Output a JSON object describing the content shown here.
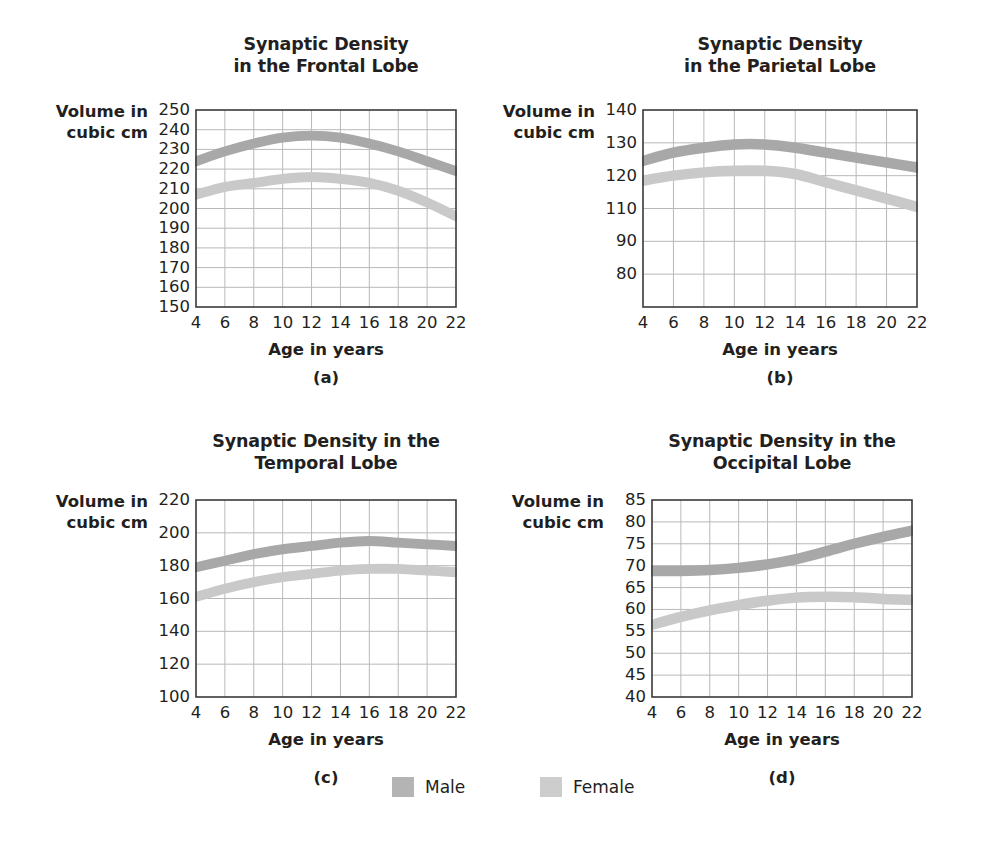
{
  "figure": {
    "axis_label": "Volume in\ncubic cm",
    "x_axis_label": "Age in years",
    "background_color": "#ffffff",
    "text_color": "#231f20",
    "grid_color": "#b9b9b9",
    "frame_color": "#3a3a3a",
    "male_color": "#a8a8a8",
    "female_color": "#c9c9c9"
  },
  "legend": {
    "entries": [
      {
        "label": "Male",
        "color": "#b4b4b4",
        "swatch": "male-swatch"
      },
      {
        "label": "Female",
        "color": "#cdcdcd",
        "swatch": "female-swatch"
      }
    ]
  },
  "chart_data": [
    {
      "id": "frontal",
      "type": "line",
      "letter": "(a)",
      "title": "Synaptic Density\nin the Frontal Lobe",
      "title_line1": "Synaptic Density",
      "title_line2": "in the Frontal Lobe",
      "xlabel": "Age in years",
      "ylabel": "Volume in cubic cm",
      "x": [
        4,
        6,
        8,
        10,
        12,
        14,
        16,
        18,
        20,
        22
      ],
      "xticks": [
        4,
        6,
        8,
        10,
        12,
        14,
        16,
        18,
        20,
        22
      ],
      "yticks": [
        250,
        240,
        230,
        220,
        210,
        200,
        190,
        180,
        170,
        160,
        150
      ],
      "xlim": [
        4,
        22
      ],
      "ylim": [
        150,
        250
      ],
      "grid": true,
      "band_width": 5,
      "series": [
        {
          "name": "Male",
          "color": "#a8a8a8",
          "values": [
            224,
            229,
            233,
            236,
            237,
            236,
            233,
            229,
            224,
            219
          ]
        },
        {
          "name": "Female",
          "color": "#c9c9c9",
          "values": [
            207,
            211,
            213,
            215,
            216,
            215,
            213,
            209,
            203,
            196
          ]
        }
      ]
    },
    {
      "id": "parietal",
      "type": "line",
      "letter": "(b)",
      "title": "Synaptic Density\nin the Parietal Lobe",
      "title_line1": "Synaptic Density",
      "title_line2": "in the Parietal Lobe",
      "xlabel": "Age in years",
      "ylabel": "Volume in cubic cm",
      "x": [
        4,
        6,
        8,
        10,
        12,
        14,
        16,
        18,
        20,
        22
      ],
      "xticks": [
        4,
        6,
        8,
        10,
        12,
        14,
        16,
        18,
        20,
        22
      ],
      "yticks": [
        140,
        130,
        120,
        110,
        90,
        80
      ],
      "ytick_positions": [
        140,
        130,
        120,
        110,
        100,
        90
      ],
      "xlim": [
        4,
        22
      ],
      "ylim": [
        80,
        140
      ],
      "grid": true,
      "band_width": 3.2,
      "series": [
        {
          "name": "Male",
          "color": "#a8a8a8",
          "values": [
            124.5,
            127,
            128.5,
            129.5,
            129.5,
            128.5,
            127,
            125.5,
            124,
            122.5
          ]
        },
        {
          "name": "Female",
          "color": "#c9c9c9",
          "values": [
            118.5,
            120,
            121,
            121.5,
            121.5,
            120.5,
            118,
            115.5,
            113,
            110.5
          ]
        }
      ]
    },
    {
      "id": "temporal",
      "type": "line",
      "letter": "(c)",
      "title": "Synaptic Density in the\nTemporal Lobe",
      "title_line1": "Synaptic Density in the",
      "title_line2": "Temporal Lobe",
      "xlabel": "Age in years",
      "ylabel": "Volume in cubic cm",
      "x": [
        4,
        6,
        8,
        10,
        12,
        14,
        16,
        18,
        20,
        22
      ],
      "xticks": [
        4,
        6,
        8,
        10,
        12,
        14,
        16,
        18,
        20,
        22
      ],
      "yticks": [
        220,
        200,
        180,
        160,
        140,
        120,
        100
      ],
      "xlim": [
        4,
        22
      ],
      "ylim": [
        100,
        220
      ],
      "grid": true,
      "band_width": 6,
      "series": [
        {
          "name": "Male",
          "color": "#a8a8a8",
          "values": [
            179,
            183,
            187,
            190,
            192,
            194,
            195,
            194,
            193,
            192
          ]
        },
        {
          "name": "Female",
          "color": "#c9c9c9",
          "values": [
            161,
            166,
            170,
            173,
            175,
            177,
            178,
            178,
            177,
            176
          ]
        }
      ]
    },
    {
      "id": "occipital",
      "type": "line",
      "letter": "(d)",
      "title": "Synaptic Density in the\nOccipital Lobe",
      "title_line1": "Synaptic Density in the",
      "title_line2": "Occipital Lobe",
      "xlabel": "Age in years",
      "ylabel": "Volume in cubic cm",
      "x": [
        4,
        6,
        8,
        10,
        12,
        14,
        16,
        18,
        20,
        22
      ],
      "xticks": [
        4,
        6,
        8,
        10,
        12,
        14,
        16,
        18,
        20,
        22
      ],
      "yticks": [
        85,
        80,
        75,
        70,
        65,
        60,
        55,
        50,
        45,
        40
      ],
      "xlim": [
        4,
        22
      ],
      "ylim": [
        40,
        85
      ],
      "grid": true,
      "band_width": 2.4,
      "series": [
        {
          "name": "Male",
          "color": "#a8a8a8",
          "values": [
            68.8,
            68.8,
            69.0,
            69.5,
            70.3,
            71.5,
            73.2,
            75.0,
            76.6,
            78.0
          ]
        },
        {
          "name": "Female",
          "color": "#c9c9c9",
          "values": [
            56.5,
            58.3,
            59.8,
            61.0,
            62.0,
            62.7,
            62.9,
            62.8,
            62.4,
            62.2
          ]
        }
      ]
    }
  ],
  "layout": {
    "panels": [
      {
        "id": "frontal",
        "plot": {
          "x": 196,
          "y": 110,
          "w": 260,
          "h": 197
        },
        "title": {
          "x": 176,
          "y": 33,
          "w": 300
        },
        "axis_name": {
          "x": 38,
          "y": 101,
          "w": 110
        },
        "ytick_right": 190,
        "xlabel": {
          "x": 196,
          "y": 340,
          "w": 260
        },
        "letter": {
          "x": 196,
          "y": 368,
          "w": 260
        }
      },
      {
        "id": "parietal",
        "plot": {
          "x": 643,
          "y": 110,
          "w": 274,
          "h": 197
        },
        "title": {
          "x": 630,
          "y": 33,
          "w": 300
        },
        "axis_name": {
          "x": 485,
          "y": 101,
          "w": 110
        },
        "ytick_right": 637,
        "xlabel": {
          "x": 643,
          "y": 340,
          "w": 274
        },
        "letter": {
          "x": 643,
          "y": 368,
          "w": 274
        }
      },
      {
        "id": "temporal",
        "plot": {
          "x": 196,
          "y": 500,
          "w": 260,
          "h": 197
        },
        "title": {
          "x": 166,
          "y": 430,
          "w": 320
        },
        "axis_name": {
          "x": 38,
          "y": 491,
          "w": 110
        },
        "ytick_right": 190,
        "xlabel": {
          "x": 196,
          "y": 730,
          "w": 260
        },
        "letter": {
          "x": 196,
          "y": 768,
          "w": 260
        }
      },
      {
        "id": "occipital",
        "plot": {
          "x": 652,
          "y": 500,
          "w": 260,
          "h": 197
        },
        "title": {
          "x": 622,
          "y": 430,
          "w": 320
        },
        "axis_name": {
          "x": 494,
          "y": 491,
          "w": 110
        },
        "ytick_right": 646,
        "xlabel": {
          "x": 652,
          "y": 730,
          "w": 260
        },
        "letter": {
          "x": 652,
          "y": 768,
          "w": 260
        }
      }
    ],
    "legend": [
      {
        "x": 392,
        "y": 777
      },
      {
        "x": 540,
        "y": 777
      }
    ]
  }
}
